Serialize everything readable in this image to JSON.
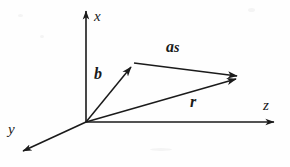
{
  "figure": {
    "type": "vector-diagram",
    "background_color": "#fefefe",
    "line_color": "#1a1a1a"
  },
  "axes": [
    {
      "name": "x-axis",
      "label": "x",
      "direction": "up",
      "origin": [
        86,
        122
      ],
      "tip": [
        86,
        7
      ],
      "label_position": [
        94,
        9
      ]
    },
    {
      "name": "y-axis",
      "label": "y",
      "direction": "down-left",
      "origin": [
        86,
        122
      ],
      "tip": [
        19,
        153
      ],
      "label_position": [
        8,
        122
      ]
    },
    {
      "name": "z-axis",
      "label": "z",
      "direction": "right",
      "origin": [
        86,
        122
      ],
      "tip": [
        279,
        122
      ],
      "label_position": [
        263,
        98
      ]
    }
  ],
  "vectors": [
    {
      "name": "vector-b",
      "label": "b",
      "style": "bold-italic",
      "start": [
        86,
        122
      ],
      "end": [
        134,
        63
      ],
      "label_position": [
        94,
        66
      ]
    },
    {
      "name": "vector-as",
      "label": "as",
      "label_main": "a",
      "label_sub": "s",
      "style": "bold-italic",
      "start": [
        134,
        63
      ],
      "end": [
        244,
        77
      ],
      "label_position": [
        166,
        39
      ]
    },
    {
      "name": "vector-r",
      "label": "r",
      "style": "bold-italic",
      "start": [
        86,
        122
      ],
      "end": [
        244,
        77
      ],
      "label_position": [
        190,
        94
      ]
    }
  ],
  "origin": {
    "name": "origin",
    "coordinates": [
      86,
      122
    ]
  }
}
